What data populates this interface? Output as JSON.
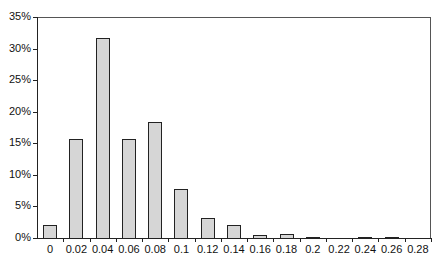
{
  "chart_data": {
    "type": "bar",
    "title": "",
    "xlabel": "",
    "ylabel": "",
    "categories": [
      "0",
      "0.02",
      "0.04",
      "0.06",
      "0.08",
      "0.1",
      "0.12",
      "0.14",
      "0.16",
      "0.18",
      "0.2",
      "0.22",
      "0.24",
      "0.26",
      "0.28"
    ],
    "values": [
      2.2,
      15.9,
      31.8,
      15.9,
      18.5,
      7.9,
      3.3,
      2.2,
      0.6,
      0.8,
      0.2,
      0,
      0.15,
      0.15,
      0
    ],
    "value_unit": "%",
    "yticks": [
      "0%",
      "5%",
      "10%",
      "15%",
      "20%",
      "25%",
      "30%",
      "35%"
    ],
    "ylim": [
      0,
      35
    ],
    "grid": false,
    "legend": null,
    "bar_color": "#d6d6d6",
    "bar_edge_color": "#222222"
  }
}
